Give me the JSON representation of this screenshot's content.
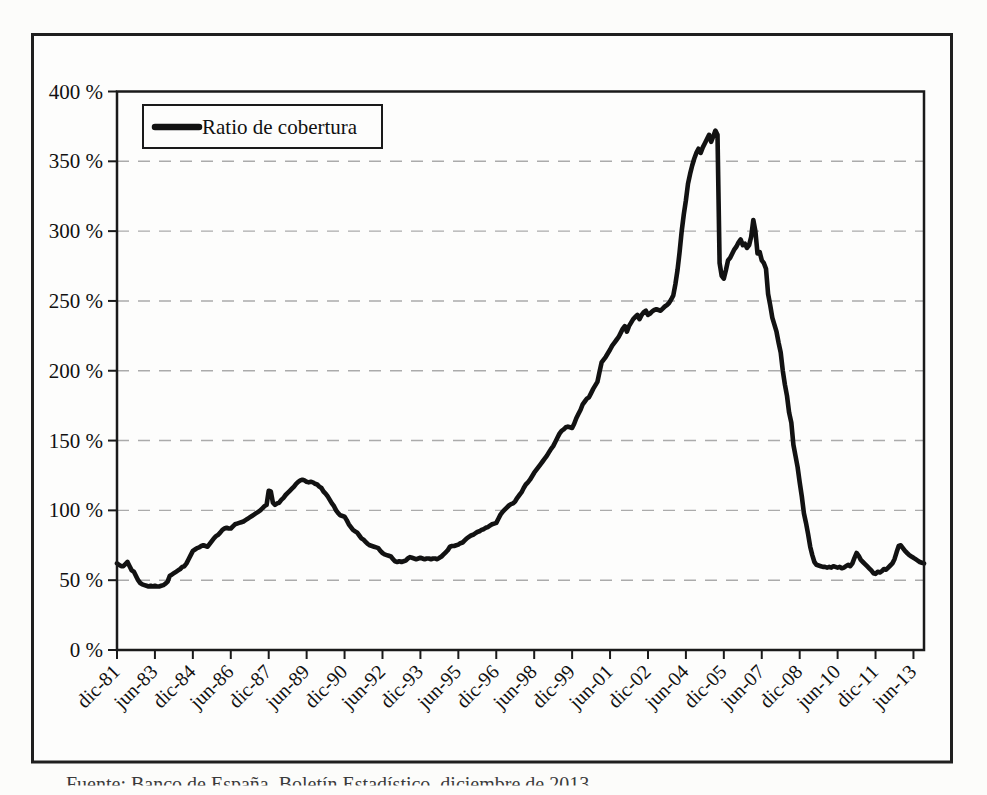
{
  "figure": {
    "legend": {
      "label": "Ratio de cobertura",
      "marker": "thick-line",
      "line_color": "#121212"
    },
    "caption": "Fuente: Banco de España, Boletín Estadístico, diciembre de 2013.",
    "border_color": "#1f1f1f",
    "background": "#fcfcfa"
  },
  "chart_data": {
    "type": "line",
    "title": "",
    "xlabel": "",
    "ylabel": "",
    "x_unit": "month",
    "x_start": "dic-1981",
    "x_end": "nov-2013",
    "ylim": [
      0,
      400
    ],
    "ytick_step": 50,
    "ytick_labels": [
      "0 %",
      "50 %",
      "100 %",
      "150 %",
      "200 %",
      "250 %",
      "300 %",
      "350 %",
      "400 %"
    ],
    "xtick_labels": [
      "dic-81",
      "jun-83",
      "dic-84",
      "jun-86",
      "dic-87",
      "jun-89",
      "dic-90",
      "jun-92",
      "dic-93",
      "jun-95",
      "dic-96",
      "jun-98",
      "dic-99",
      "jun-01",
      "dic-02",
      "jun-04",
      "dic-05",
      "jun-07",
      "dic-08",
      "jun-10",
      "dic-11",
      "jun-13"
    ],
    "xtick_month_index": [
      0,
      18,
      36,
      54,
      72,
      90,
      108,
      126,
      144,
      162,
      180,
      198,
      216,
      234,
      252,
      270,
      288,
      306,
      324,
      342,
      360,
      378
    ],
    "grid": "dashed-horizontal",
    "legend_position": "top-left-inside",
    "series": [
      {
        "name": "Ratio de cobertura",
        "color": "#121212",
        "monthly_values_pct": [
          62,
          61,
          60,
          60,
          61.5,
          63,
          60,
          57,
          56,
          53,
          50,
          48,
          47,
          46.5,
          46,
          45.5,
          46,
          45.5,
          46,
          45.5,
          45.5,
          46,
          46.5,
          47.5,
          49,
          53,
          54,
          55,
          56,
          57,
          58,
          59.5,
          60,
          62,
          65,
          68,
          71,
          72,
          73,
          73.5,
          74.5,
          75,
          74.5,
          74,
          76,
          78,
          80,
          81.5,
          82.5,
          84,
          86,
          87,
          87.5,
          87,
          87,
          88.5,
          90,
          90.5,
          91,
          91.5,
          92,
          93,
          94,
          95,
          96,
          97,
          98,
          99,
          100,
          101.5,
          103,
          104,
          114,
          113.5,
          105.5,
          104,
          105,
          105.5,
          107.5,
          109,
          111,
          112.5,
          114,
          115.5,
          117,
          119,
          120.5,
          121.5,
          122,
          121.5,
          120.5,
          120,
          120.5,
          120,
          119,
          118.5,
          117,
          116,
          113.5,
          112,
          110,
          107.5,
          105,
          103,
          100,
          98,
          96.5,
          96,
          95.5,
          93,
          90,
          88,
          86,
          85,
          84,
          82,
          80,
          79,
          77.5,
          76,
          75,
          74.5,
          74,
          73.5,
          73,
          71,
          69.5,
          68.5,
          68,
          67.5,
          67,
          65,
          63.5,
          63,
          63.5,
          63,
          63.5,
          64,
          65.5,
          66.5,
          66,
          65.5,
          65,
          65.5,
          66,
          65.5,
          65,
          65.5,
          65.5,
          65,
          65.5,
          65.5,
          65,
          66,
          67,
          68.5,
          70,
          71.5,
          74,
          74.5,
          74.5,
          75,
          75.5,
          76.5,
          77,
          78.5,
          80,
          81,
          82,
          82.5,
          83.5,
          84.5,
          85,
          86,
          86.5,
          87.5,
          88,
          89,
          90,
          90.5,
          91,
          94,
          97,
          99,
          100.5,
          102,
          103.5,
          104.5,
          105,
          106.5,
          109,
          111,
          113,
          116,
          118.5,
          120,
          122,
          124.5,
          127,
          129,
          131,
          133,
          135,
          137,
          139,
          141.5,
          144,
          146,
          149,
          152,
          155,
          157,
          158,
          159.5,
          160,
          159.5,
          159,
          162,
          166,
          169,
          172,
          176,
          178,
          180,
          181,
          184,
          187,
          189.5,
          192,
          199,
          206,
          208,
          210,
          212.5,
          215,
          218,
          220,
          222,
          224,
          227,
          230,
          232,
          228,
          232,
          234.5,
          237,
          238.5,
          240,
          237,
          240,
          242,
          243,
          240,
          241,
          242.5,
          243.5,
          244,
          243.5,
          243,
          244.5,
          246,
          247,
          248.5,
          251,
          254,
          262,
          272,
          285,
          300,
          312,
          322,
          334,
          341,
          347,
          352,
          356,
          359,
          356,
          360,
          363,
          366,
          369,
          364,
          368,
          372,
          369,
          277,
          268,
          266,
          272,
          279,
          281,
          284,
          287,
          289,
          292,
          294,
          290,
          291,
          288,
          290,
          296,
          308,
          300,
          284,
          285,
          279,
          277,
          273,
          255,
          247,
          238,
          233,
          228,
          220,
          213,
          200,
          190,
          182,
          170,
          163,
          147,
          139,
          131,
          120,
          110,
          98,
          91,
          83,
          74,
          68,
          63,
          61,
          60.5,
          60,
          59.5,
          59.5,
          59,
          59.5,
          59,
          60,
          59.5,
          59,
          59.5,
          58.5,
          59,
          60,
          61,
          60,
          62,
          66,
          69.5,
          67.5,
          64.5,
          63,
          61.5,
          60,
          58.5,
          57,
          55,
          54.5,
          56,
          55.5,
          56.5,
          58,
          57.5,
          59,
          60.5,
          62,
          65,
          70,
          74.5,
          75,
          73,
          71,
          69.5,
          68,
          67,
          66,
          65,
          64,
          63,
          62.5,
          62
        ]
      }
    ]
  }
}
